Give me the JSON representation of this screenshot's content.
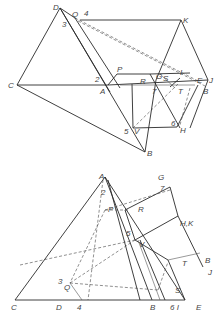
{
  "figure": {
    "top_view": {
      "labels": {
        "D": "D",
        "Q": "Q",
        "n4": "4",
        "n3": "3",
        "K": "K",
        "C": "C",
        "P": "P",
        "n2": "2",
        "A": "A",
        "R": "R",
        "G": "G",
        "S": "S",
        "I": "I",
        "n7": "7",
        "T": "T",
        "E": "E",
        "J": "J",
        "B": "B",
        "n5": "5",
        "V": "V",
        "n6": "6",
        "H": "H",
        "Bb": "B"
      }
    },
    "front_view": {
      "labels": {
        "A": "A",
        "n2": "2",
        "G": "G",
        "n7": "7",
        "P": "P",
        "R": "R",
        "HK": "H,K",
        "n5": "5",
        "V": "V",
        "T": "T",
        "B": "B",
        "J": "J",
        "n3": "3",
        "Q": "Q",
        "S": "S",
        "C": "C",
        "D": "D",
        "n4": "4",
        "Bb": "B",
        "n6I": "6 I",
        "E": "E"
      }
    }
  }
}
